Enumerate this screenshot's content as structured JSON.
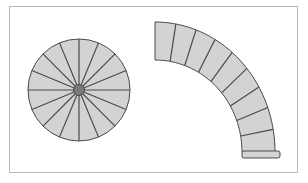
{
  "diagram": {
    "type": "spiral-staircase-plans",
    "colors": {
      "tread_fill": "#d3d3d3",
      "stroke": "#4a4a4a",
      "hub_fill": "#7a7a7a",
      "frame": "#b8b8b8",
      "background": "#ffffff"
    },
    "spiral_stair": {
      "center": [
        79,
        90
      ],
      "radius": 51,
      "hub_radius": 5.5,
      "tread_count": 16
    },
    "curved_stair": {
      "center": [
        155,
        152
      ],
      "outer_rx": 120,
      "outer_ry": 130,
      "inner_rx": 87,
      "inner_ry": 92,
      "tread_count": 9,
      "landing": {
        "x": 242,
        "y": 151,
        "width": 38,
        "height": 7
      }
    }
  }
}
